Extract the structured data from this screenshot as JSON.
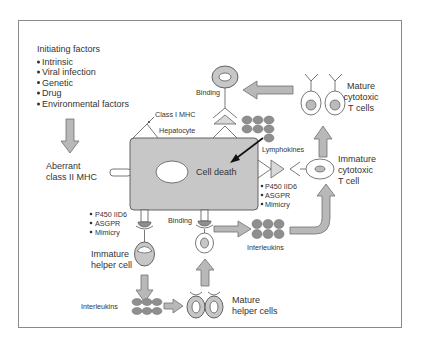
{
  "colors": {
    "cell_fill": "#c7c7c7",
    "cell_stroke": "#555555",
    "arrow_fill": "#b5b5b5",
    "arrow_stroke": "#6e6e6e",
    "dot_fill": "#8f8f8f",
    "frame": "#8a8a8a",
    "text": "#333333"
  },
  "initiating": {
    "title": "Initiating factors",
    "items": [
      "Intrinsic",
      "Viral infection",
      "Genetic",
      "Drug",
      "Environmental factors"
    ]
  },
  "aberrant": {
    "line1": "Aberrant",
    "line2": "class II MHC"
  },
  "hepatocyte": {
    "label": "Hepatocyte",
    "class1": "Class I MHC",
    "cell_death": "Cell death"
  },
  "top": {
    "binding": "Binding",
    "lymphokines": "Lymphokines"
  },
  "cytotoxic": {
    "mature": {
      "line1": "Mature",
      "line2": "cytotoxic",
      "line3": "T cells"
    },
    "immature": {
      "line1": "Immature",
      "line2": "cytotoxic",
      "line3": "T cell"
    }
  },
  "antigens_right": [
    "P450 IID6",
    "ASGPR",
    "Mimicry"
  ],
  "antigens_left": [
    "P450 IID6",
    "ASGPR",
    "Mimicry"
  ],
  "helper": {
    "immature": {
      "line1": "Immature",
      "line2": "helper cell"
    },
    "mature": {
      "line1": "Mature",
      "line2": "helper cells"
    },
    "binding": "Binding"
  },
  "interleukins": {
    "left": "Interleukins",
    "middle": "Interleukins"
  }
}
